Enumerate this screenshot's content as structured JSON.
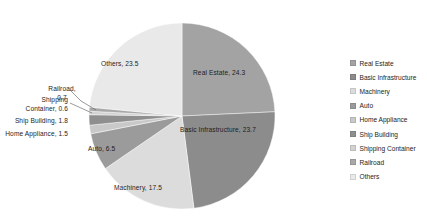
{
  "chart_data": {
    "type": "pie",
    "title": "",
    "xlabel": "",
    "ylabel": "",
    "legend_position": "right",
    "grid": false,
    "categories": [
      "Real Estate",
      "Basic Infrastructure",
      "Machinery",
      "Auto",
      "Home Appliance",
      "Ship Building",
      "Shipping Container",
      "Railroad",
      "Others"
    ],
    "values": [
      24.3,
      23.7,
      17.5,
      6.5,
      1.5,
      1.8,
      0.6,
      0.7,
      23.5
    ],
    "colors": [
      "#a3a3a3",
      "#8c8c8c",
      "#dcdcdc",
      "#9b9b9b",
      "#c9c9c9",
      "#8f8f8f",
      "#d2d2d2",
      "#a8a8a8",
      "#e9e9e9"
    ],
    "slices": [
      {
        "name": "Real Estate",
        "value": 24.3,
        "color": "#a3a3a3",
        "label": "Real Estate, 24.3"
      },
      {
        "name": "Basic Infrastructure",
        "value": 23.7,
        "color": "#8c8c8c",
        "label": "Basic Infrastructure, 23.7"
      },
      {
        "name": "Machinery",
        "value": 17.5,
        "color": "#dcdcdc",
        "label": "Machinery, 17.5"
      },
      {
        "name": "Auto",
        "value": 6.5,
        "color": "#9b9b9b",
        "label": "Auto, 6.5"
      },
      {
        "name": "Home Appliance",
        "value": 1.5,
        "color": "#c9c9c9",
        "label": "Home Appliance, 1.5"
      },
      {
        "name": "Ship Building",
        "value": 1.8,
        "color": "#8f8f8f",
        "label": "Ship Building, 1.8"
      },
      {
        "name": "Shipping Container",
        "value": 0.6,
        "color": "#d2d2d2",
        "label": "Shipping Container, 0.6"
      },
      {
        "name": "Railroad",
        "value": 0.7,
        "color": "#a8a8a8",
        "label": "Railroad, 0.7"
      },
      {
        "name": "Others",
        "value": 23.5,
        "color": "#e9e9e9",
        "label": "Others, 23.5"
      }
    ]
  },
  "labels": {
    "real_estate": "Real Estate, 24.3",
    "basic_infrastructure": "Basic Infrastructure, 23.7",
    "machinery": "Machinery, 17.5",
    "auto": "Auto, 6.5",
    "others": "Others, 23.5",
    "railroad_l1": "Railroad,",
    "railroad_l2": "0.7",
    "shipping_container_l1": "Shipping",
    "shipping_container_l2": "Container, 0.6",
    "ship_building": "Ship Building, 1.8",
    "home_appliance": "Home Appliance, 1.5"
  },
  "legend": {
    "items": [
      {
        "label": "Real Estate",
        "color": "#a3a3a3"
      },
      {
        "label": "Basic Infrastructure",
        "color": "#8c8c8c"
      },
      {
        "label": "Machinery",
        "color": "#dcdcdc"
      },
      {
        "label": "Auto",
        "color": "#9b9b9b"
      },
      {
        "label": "Home Appliance",
        "color": "#c9c9c9"
      },
      {
        "label": "Ship Building",
        "color": "#8f8f8f"
      },
      {
        "label": "Shipping Container",
        "color": "#d2d2d2"
      },
      {
        "label": "Railroad",
        "color": "#a8a8a8"
      },
      {
        "label": "Others",
        "color": "#e9e9e9"
      }
    ]
  }
}
